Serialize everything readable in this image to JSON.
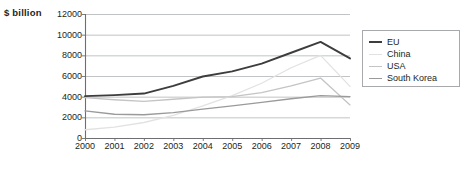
{
  "chart_data": {
    "type": "line",
    "title": "",
    "ylabel": "$ billion",
    "xlabel": "",
    "grid": true,
    "legend_position": "right",
    "ylim": [
      0,
      12000
    ],
    "ytick_labels": [
      "12000",
      "10000",
      "8000",
      "6000",
      "4000",
      "2000",
      "0"
    ],
    "ytick_values": [
      12000,
      10000,
      8000,
      6000,
      4000,
      2000,
      0
    ],
    "categories": [
      "2000",
      "2001",
      "2002",
      "2003",
      "2004",
      "2005",
      "2006",
      "2007",
      "2008",
      "2009"
    ],
    "x": [
      2000,
      2001,
      2002,
      2003,
      2004,
      2005,
      2006,
      2007,
      2008,
      2009
    ],
    "series": [
      {
        "name": "EU",
        "color": "#3d3d3d",
        "width": 1.9,
        "values": [
          4050,
          4150,
          4300,
          5050,
          5950,
          6450,
          7200,
          8250,
          9300,
          7700
        ]
      },
      {
        "name": "China",
        "color": "#e2e2e2",
        "width": 1.3,
        "values": [
          800,
          1050,
          1500,
          2200,
          3100,
          4100,
          5300,
          6800,
          8000,
          5000
        ]
      },
      {
        "name": "USA",
        "color": "#c4c4c4",
        "width": 1.3,
        "values": [
          3900,
          3700,
          3550,
          3750,
          3950,
          4000,
          4400,
          5050,
          5800,
          3200
        ]
      },
      {
        "name": "South Korea",
        "color": "#9a9a9a",
        "width": 1.3,
        "values": [
          2620,
          2300,
          2250,
          2450,
          2800,
          3100,
          3450,
          3800,
          4100,
          4000
        ]
      }
    ]
  },
  "legend": {
    "items": [
      {
        "label": "EU"
      },
      {
        "label": "China"
      },
      {
        "label": "USA"
      },
      {
        "label": "South Korea"
      }
    ]
  },
  "axes": {
    "axis_color": "#6d6e71",
    "grid_color": "#a7a9ac",
    "plot_bg": "#ffffff"
  }
}
